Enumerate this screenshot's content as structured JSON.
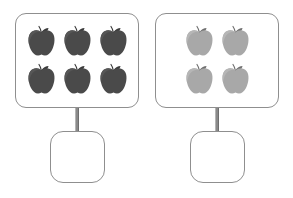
{
  "worksheet": {
    "title": "Counting apples worksheet",
    "background_color": "#ffffff",
    "box_border_color": "#8f8f8f",
    "connector_color": "#8a8a8a"
  },
  "groups": [
    {
      "id": "left",
      "set_box_name": "apple-set-box-left",
      "item_icon": "apple-icon",
      "item_color": "#4a4a4a",
      "item_stem_color": "#3a3a3a",
      "count": 6,
      "rows": [
        [
          "apple",
          "apple",
          "apple"
        ],
        [
          "apple",
          "apple",
          "apple"
        ]
      ],
      "answer_box_name": "answer-box-left",
      "answer_value": "",
      "answer_placeholder": ""
    },
    {
      "id": "right",
      "set_box_name": "apple-set-box-right",
      "item_icon": "apple-icon",
      "item_color": "#a8a8a8",
      "item_stem_color": "#6f6f6f",
      "count": 4,
      "rows": [
        [
          "apple",
          "apple"
        ],
        [
          "apple",
          "apple"
        ]
      ],
      "answer_box_name": "answer-box-right",
      "answer_value": "",
      "answer_placeholder": ""
    }
  ]
}
